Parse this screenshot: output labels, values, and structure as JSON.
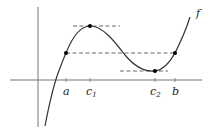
{
  "diagram": {
    "function_label": "f",
    "x_labels": [
      {
        "id": "a",
        "text": "a",
        "sub": ""
      },
      {
        "id": "c1",
        "text": "c",
        "sub": "1"
      },
      {
        "id": "c2",
        "text": "c",
        "sub": "2"
      },
      {
        "id": "b",
        "text": "b",
        "sub": ""
      }
    ],
    "points": [
      "f(a)",
      "f(c1) local max",
      "f(c2) local min",
      "f(b)"
    ],
    "colors": {
      "curve": "#333333",
      "axes": "#555555",
      "dash": "#444444",
      "point": "#000000"
    }
  }
}
